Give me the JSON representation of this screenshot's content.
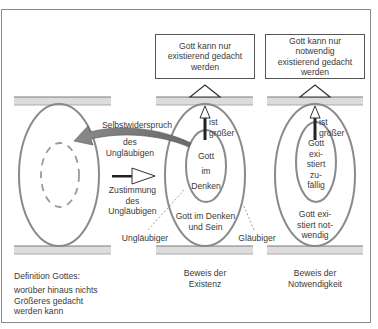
{
  "diagram": {
    "colors": {
      "ellipse": "#8a8a8a",
      "shelf_fill": "#dcdcdc",
      "shelf_line": "#7a7a7a",
      "arrow_fill": "#7d7d7d",
      "text": "#3a3a3a"
    },
    "boxes": {
      "existence": "Gott kann nur existierend gedacht werden",
      "necessity": "Gott kann nur notwendig existierend gedacht werden"
    },
    "left_column": {
      "definition_title": "Definition Gottes:",
      "definition_text": "worüber hinaus nichts Größeres gedacht werden kann"
    },
    "arrows": {
      "self_contradiction": [
        "Selbstwiderspruch",
        "des",
        "Ungläubigen"
      ],
      "consent": [
        "Zustimmung",
        "des",
        "Ungläubigen"
      ]
    },
    "middle_column": {
      "greater_label": [
        "ist",
        "größer"
      ],
      "inner": [
        "Gott",
        "im",
        "Denken"
      ],
      "outer": [
        "Gott im Denken",
        "und Sein"
      ],
      "unbeliever": "Ungläubiger",
      "believer": "Gläubiger",
      "caption": [
        "Beweis der",
        "Existenz"
      ]
    },
    "right_column": {
      "greater_label": [
        "ist",
        "größer"
      ],
      "inner": [
        "Gott",
        "exi-",
        "stiert",
        "zu-",
        "fällig"
      ],
      "outer": [
        "Gott exi-",
        "stiert not-",
        "wendig"
      ],
      "caption": [
        "Beweis der",
        "Notwendigkeit"
      ]
    }
  }
}
